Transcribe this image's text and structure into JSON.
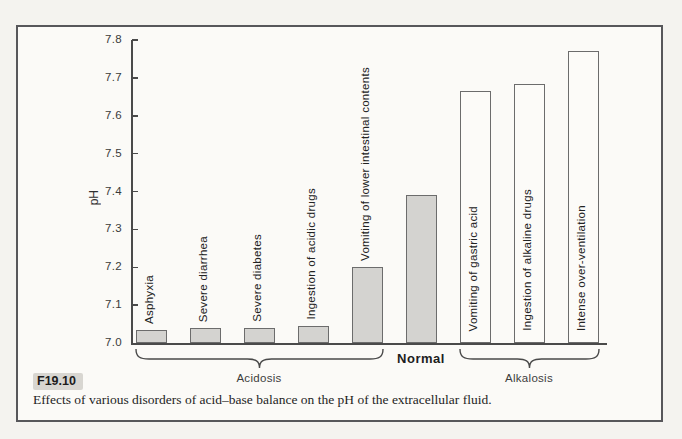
{
  "caption": {
    "figure_label": "F19.10",
    "text": "Effects of various disorders of acid–base balance on the pH of the extracellular fluid."
  },
  "chart_data": {
    "type": "bar",
    "title": "",
    "xlabel": "",
    "ylabel": "pH",
    "ylim": [
      7.0,
      7.8
    ],
    "yticks": [
      7.0,
      7.1,
      7.2,
      7.3,
      7.4,
      7.5,
      7.6,
      7.7,
      7.8
    ],
    "grid": false,
    "categories": [
      "Asphyxia",
      "Severe diarrhea",
      "Severe diabetes",
      "Ingestion of acidic drugs",
      "Vomiting of lower intestinal contents",
      "Normal",
      "Vomiting of gastric acid",
      "Ingestion of alkaline drugs",
      "Intense over-ventilation"
    ],
    "values": [
      7.035,
      7.04,
      7.04,
      7.045,
      7.2,
      7.39,
      7.665,
      7.685,
      7.77
    ],
    "bars": [
      {
        "label": "Asphyxia",
        "value": 7.035,
        "fill": "gray",
        "label_position": "above"
      },
      {
        "label": "Severe diarrhea",
        "value": 7.04,
        "fill": "gray",
        "label_position": "above"
      },
      {
        "label": "Severe diabetes",
        "value": 7.04,
        "fill": "gray",
        "label_position": "above"
      },
      {
        "label": "Ingestion of acidic drugs",
        "value": 7.045,
        "fill": "gray",
        "label_position": "above"
      },
      {
        "label": "Vomiting of lower intestinal contents",
        "value": 7.2,
        "fill": "gray",
        "label_position": "above"
      },
      {
        "label": "Normal",
        "value": 7.39,
        "fill": "gray",
        "label_position": "below"
      },
      {
        "label": "Vomiting of gastric acid",
        "value": 7.665,
        "fill": "white",
        "label_position": "inside"
      },
      {
        "label": "Ingestion of alkaline drugs",
        "value": 7.685,
        "fill": "white",
        "label_position": "inside"
      },
      {
        "label": "Intense over-ventilation",
        "value": 7.77,
        "fill": "white",
        "label_position": "inside"
      }
    ],
    "groups": [
      {
        "label": "Acidosis",
        "from": 0,
        "to": 4
      },
      {
        "label": "Alkalosis",
        "from": 6,
        "to": 8
      }
    ],
    "colors": {
      "gray_bar_fill": "#d4d3d0",
      "white_bar_fill": "#fcfbf8",
      "bar_border": "#6c6c6c",
      "axis": "#4a4a4a",
      "frame_border": "#57575a",
      "background": "#fbfaf7",
      "highlight": "#d8d6d1"
    }
  }
}
